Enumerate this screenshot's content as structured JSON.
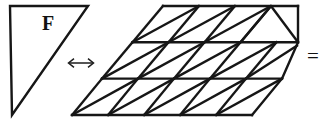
{
  "figure": {
    "name": "sheared-triangular-grid-tiling-diagram",
    "background_color": "#ffffff",
    "stroke_color": "#161616",
    "width": 327,
    "height": 131
  },
  "left_shape": {
    "name": "right-triangle-F",
    "label": "F",
    "label_x": 48,
    "label_y": 25,
    "vertices": "10,6 88,6 12,115",
    "description": "right triangle with vertical left edge, horizontal top edge, hypotenuse from top-right to bottom-left"
  },
  "measure_arrow": {
    "name": "double-headed-arrow",
    "glyph": "double-arrow-horizontal",
    "x1": 68,
    "x2": 94,
    "y": 63,
    "head_size": 4.5
  },
  "grid": {
    "name": "sheared-parallelogram-grid",
    "columns": 5,
    "rows": 3,
    "cell_width": 36,
    "row_height": 36.3,
    "shear_per_row": 30,
    "origin_x": 72,
    "origin_y": 115,
    "top_left_x": 163,
    "top_left_y": 6,
    "row_y": [
      6,
      42.3,
      78.6,
      115
    ],
    "diagonal_direction_default": "bottom-left-to-top-right",
    "diagonal_overrides": [
      {
        "row": 0,
        "col": 4,
        "direction": "top-left-to-bottom-right"
      }
    ]
  },
  "equals_sign": {
    "name": "equals-sign",
    "text": "=",
    "x": 313,
    "y": 58
  }
}
